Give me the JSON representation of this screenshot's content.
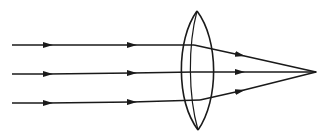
{
  "diagram": {
    "type": "converging-lens-ray-diagram",
    "colors": {
      "stroke": "#1a1a1a",
      "background": "#ffffff"
    },
    "lens": {
      "center_x": 197,
      "top_y": 11,
      "bottom_y": 130,
      "half_width": 15
    },
    "focal_point": {
      "x": 316,
      "y": 72
    },
    "rays": [
      {
        "name": "top-ray",
        "start": [
          12,
          45
        ],
        "lens_hit": [
          194,
          45
        ],
        "exit": [
          210,
          47
        ]
      },
      {
        "name": "middle-ray",
        "start": [
          12,
          74
        ],
        "lens_hit": [
          194,
          73
        ],
        "exit": [
          210,
          72
        ]
      },
      {
        "name": "bottom-ray",
        "start": [
          12,
          103
        ],
        "lens_hit": [
          194,
          101
        ],
        "exit": [
          210,
          99
        ]
      }
    ]
  }
}
